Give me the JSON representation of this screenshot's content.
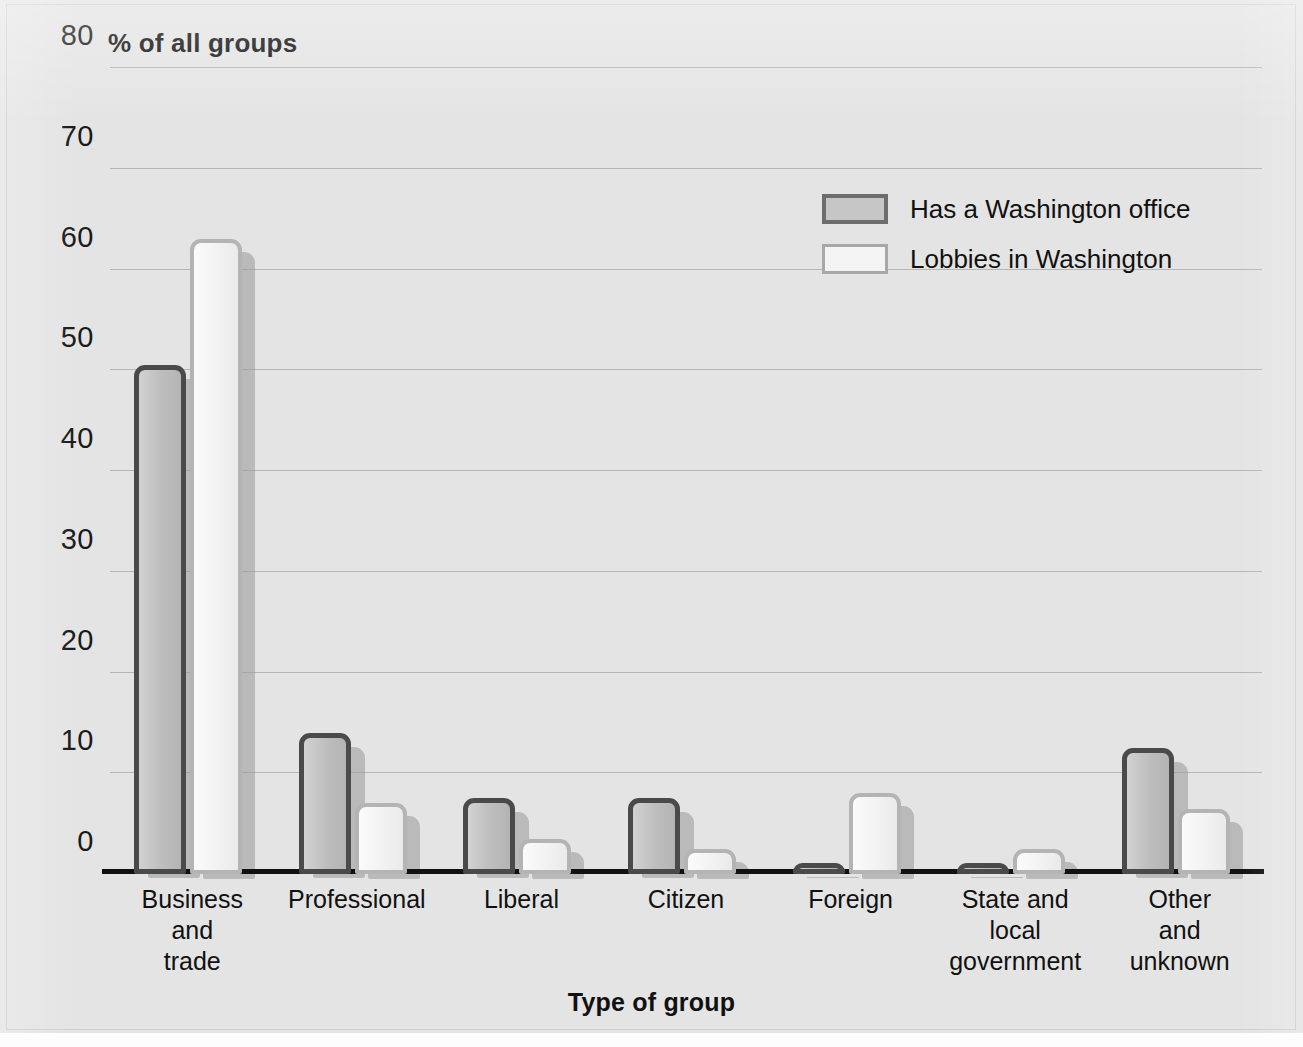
{
  "chart_data": {
    "type": "bar",
    "title": "",
    "ylabel": "% of all groups",
    "xlabel": "Type of group",
    "ylim": [
      0,
      80
    ],
    "yticks": [
      0,
      10,
      20,
      30,
      40,
      50,
      60,
      70,
      80
    ],
    "ytick_labels": [
      "0",
      "10",
      "20",
      "30",
      "40",
      "50",
      "60",
      "70",
      "80"
    ],
    "grid": true,
    "legend_position": "upper right",
    "categories": [
      "Business\nand\ntrade",
      "Professional",
      "Liberal",
      "Citizen",
      "Foreign",
      "State and\nlocal\ngovernment",
      "Other\nand\nunknown"
    ],
    "category_lines": [
      [
        "Business",
        "and",
        "trade"
      ],
      [
        "Professional"
      ],
      [
        "Liberal"
      ],
      [
        "Citizen"
      ],
      [
        "Foreign"
      ],
      [
        "State and",
        "local",
        "government"
      ],
      [
        "Other",
        "and",
        "unknown"
      ]
    ],
    "series": [
      {
        "name": "Has a Washington office",
        "color": "#c3c3c3",
        "edge_color": "#4a4a4a",
        "values": [
          50.5,
          14,
          7.5,
          7.5,
          1,
          0.5,
          12.5
        ]
      },
      {
        "name": "Lobbies in Washington",
        "color": "#f4f4f4",
        "edge_color": "#b4b4b4",
        "values": [
          63,
          7,
          3.5,
          2.5,
          8,
          2.5,
          6.5
        ]
      }
    ]
  },
  "colors": {
    "background": "#e4e4e4",
    "axis": "#111111",
    "gridline": "#9a9a9a",
    "text": "#1a1a1a"
  }
}
